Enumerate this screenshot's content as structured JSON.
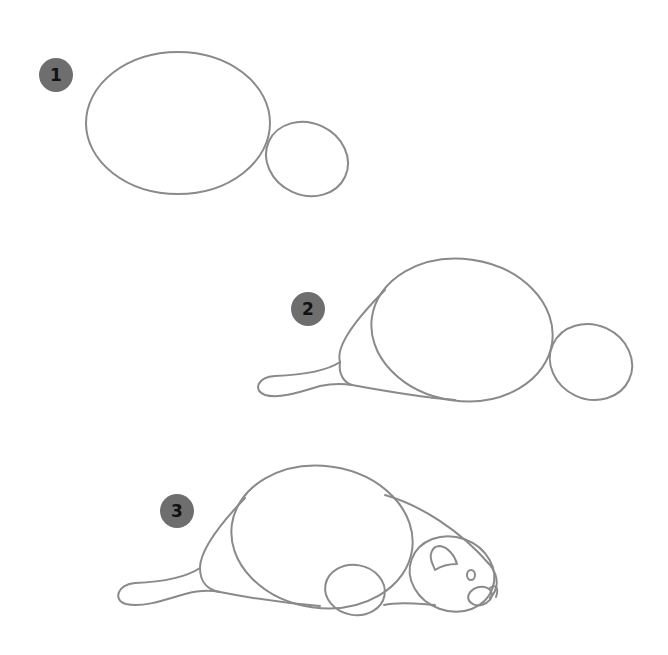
{
  "colors": {
    "line": "#8a8a8a",
    "badge": "#6e6e6e",
    "badge_text": "#111111",
    "background": "#ffffff"
  },
  "steps": [
    {
      "number": "1",
      "description": "Body oval and head oval"
    },
    {
      "number": "2",
      "description": "Add haunch contour and tail"
    },
    {
      "number": "3",
      "description": "Add back contour, front paw, ear, eye and nose"
    }
  ]
}
